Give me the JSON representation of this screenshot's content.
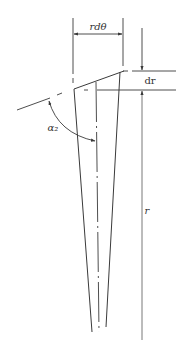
{
  "diagram": {
    "type": "wedge-element-geometry",
    "labels": {
      "arc_width": "rdθ",
      "radial_increment": "dr",
      "radius": "r",
      "angle": "α₂"
    },
    "colors": {
      "line": "#3a3a3a",
      "light_line": "#6a6a6a",
      "background": "#ffffff"
    }
  }
}
